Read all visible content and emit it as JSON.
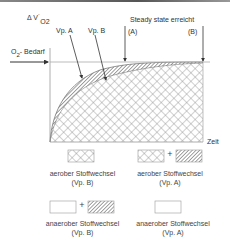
{
  "diagram": {
    "y_axis_label": "Δ V˙",
    "y_axis_subscript": "O2",
    "x_axis_label": "Zeit",
    "demand_label": "O",
    "demand_subscript": "2",
    "demand_suffix": "- Bedarf",
    "curve_labels": {
      "a": "Vp. A",
      "b": "Vp. B"
    },
    "steady_state_label": "Steady state erreicht",
    "markers": {
      "a": "(A)",
      "b": "(B)"
    },
    "colors": {
      "line": "#333333",
      "pattern": "#777777",
      "background": "#ffffff"
    }
  },
  "legend": {
    "items": [
      {
        "id": "aerob-b",
        "label": "aerober Stoffwechsel",
        "sub": "(Vp. B)",
        "swatches": [
          "crosshatch"
        ]
      },
      {
        "id": "aerob-a",
        "label": "aerober Stoffwechsel",
        "sub": "(Vp. A)",
        "swatches": [
          "crosshatch",
          "diagonal"
        ],
        "plus": "+"
      },
      {
        "id": "anaerob-b",
        "label": "anaerober Stoffwechsel",
        "sub": "(Vp. B)",
        "swatches": [
          "empty",
          "diagonal"
        ],
        "plus": "+"
      },
      {
        "id": "anaerob-a",
        "label": "anaerober Stoffwechsel",
        "sub": "(Vp. A)",
        "swatches": [
          "empty"
        ]
      }
    ]
  }
}
